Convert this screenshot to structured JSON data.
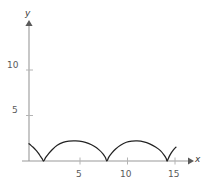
{
  "chart_data": {
    "type": "line",
    "title": "",
    "xlabel": "x",
    "ylabel": "y",
    "xlim": [
      -0.7,
      16.9
    ],
    "ylim": [
      -0.5,
      15.3
    ],
    "grid": false,
    "legend": null,
    "xticks": [
      5,
      10,
      15
    ],
    "xtick_labels": [
      "5",
      "10",
      "15"
    ],
    "yticks": [
      5,
      10
    ],
    "ytick_labels": [
      "5",
      "10"
    ],
    "curve_color": "#222222",
    "axis_color": "#9a9a9a",
    "tick_label_color": "#5a5a5a",
    "cusps_x": [
      1.5,
      8.0,
      14.2
    ],
    "arch_peak_y": 2.2,
    "arch_peaks_x": [
      4.8,
      11.1
    ],
    "start_point": [
      0,
      1.9
    ],
    "end_point": [
      15.1,
      1.5
    ],
    "series": [
      {
        "name": "cycloid",
        "x": [
          0.0,
          0.2,
          0.4,
          0.6,
          0.8,
          1.0,
          1.2,
          1.35,
          1.5,
          1.7,
          2.0,
          2.4,
          2.9,
          3.5,
          4.1,
          4.8,
          5.5,
          6.1,
          6.7,
          7.2,
          7.6,
          7.85,
          8.0,
          8.2,
          8.5,
          8.9,
          9.4,
          10.0,
          10.6,
          11.1,
          11.8,
          12.4,
          13.0,
          13.5,
          13.9,
          14.1,
          14.2,
          14.4,
          14.6,
          14.8,
          15.0,
          15.1
        ],
        "y": [
          1.9,
          1.72,
          1.53,
          1.32,
          1.08,
          0.8,
          0.48,
          0.25,
          0.0,
          0.36,
          0.78,
          1.26,
          1.72,
          2.04,
          2.18,
          2.2,
          2.12,
          1.93,
          1.62,
          1.22,
          0.78,
          0.38,
          0.0,
          0.42,
          0.86,
          1.32,
          1.74,
          2.06,
          2.18,
          2.2,
          2.1,
          1.88,
          1.54,
          1.14,
          0.62,
          0.26,
          0.0,
          0.48,
          0.86,
          1.16,
          1.42,
          1.52
        ]
      }
    ]
  },
  "axes": {
    "y_name": "y",
    "x_name": "x",
    "y_tick_5": "5",
    "y_tick_10": "10",
    "x_tick_5": "5",
    "x_tick_10": "10",
    "x_tick_15": "15"
  }
}
